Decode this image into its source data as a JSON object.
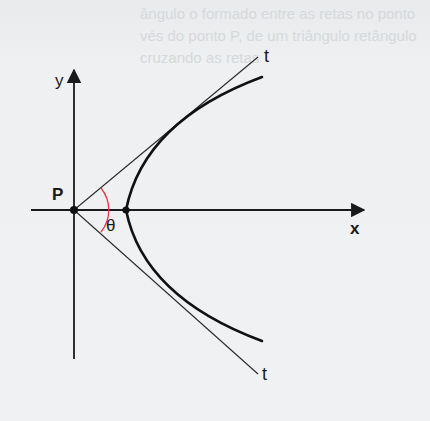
{
  "figure": {
    "type": "hyperbola-asymptote-angle-diagram",
    "labels": {
      "y_axis": "y",
      "x_axis": "x",
      "point": "P",
      "angle": "θ",
      "tangent_top": "t",
      "tangent_bottom": "t"
    },
    "colors": {
      "ink": "#1a1a1a",
      "angle_arc": "#e0394a",
      "background": "#eff1f2"
    }
  },
  "show_through_text": [
    "ângulo o formado entre as retas no ponto",
    "vés do ponto P, de um triângulo retângulo",
    "cruzando as retas"
  ]
}
